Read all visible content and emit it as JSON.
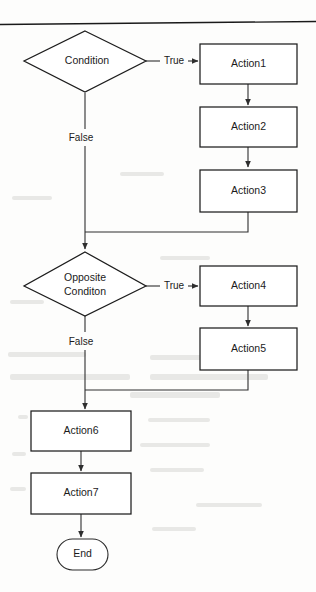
{
  "diagram": {
    "type": "flowchart",
    "colors": {
      "stroke": "#1d1d1d",
      "text": "#1b1b1b",
      "background": "#fdfdfc",
      "connector": "#2e2e2e"
    },
    "nodes": [
      {
        "id": "cond1",
        "shape": "diamond",
        "label": "Condition",
        "cx": 85,
        "cy": 61
      },
      {
        "id": "cond2a",
        "shape": "diamond",
        "label": "Opposite",
        "cx": 85,
        "cy": 277
      },
      {
        "id": "cond2b",
        "shape": "diamond",
        "label": "Conditon",
        "cx": 85,
        "cy": 290
      },
      {
        "id": "action1",
        "shape": "process",
        "label": "Action1",
        "cx": 248,
        "cy": 63
      },
      {
        "id": "action2",
        "shape": "process",
        "label": "Action2",
        "cx": 248,
        "cy": 127
      },
      {
        "id": "action3",
        "shape": "process",
        "label": "Action3",
        "cx": 248,
        "cy": 191
      },
      {
        "id": "action4",
        "shape": "process",
        "label": "Action4",
        "cx": 248,
        "cy": 286
      },
      {
        "id": "action5",
        "shape": "process",
        "label": "Action5",
        "cx": 248,
        "cy": 349
      },
      {
        "id": "action6",
        "shape": "process",
        "label": "Action6",
        "cx": 81,
        "cy": 431
      },
      {
        "id": "action7",
        "shape": "process",
        "label": "Action7",
        "cx": 81,
        "cy": 493
      },
      {
        "id": "end",
        "shape": "terminal",
        "label": "End",
        "cx": 82,
        "cy": 554
      }
    ],
    "edge_labels": {
      "true_1": "True",
      "false_1": "False",
      "true_2": "True",
      "false_2": "False"
    },
    "edges": [
      {
        "from": "cond1",
        "to": "action1",
        "label": "True"
      },
      {
        "from": "cond1",
        "to": "cond2a",
        "label": "False"
      },
      {
        "from": "action1",
        "to": "action2",
        "label": ""
      },
      {
        "from": "action2",
        "to": "action3",
        "label": ""
      },
      {
        "from": "action3",
        "to": "cond2a",
        "label": ""
      },
      {
        "from": "cond2a",
        "to": "action4",
        "label": "True"
      },
      {
        "from": "cond2a",
        "to": "action6",
        "label": "False"
      },
      {
        "from": "action4",
        "to": "action5",
        "label": ""
      },
      {
        "from": "action5",
        "to": "action6",
        "label": ""
      },
      {
        "from": "action6",
        "to": "action7",
        "label": ""
      },
      {
        "from": "action7",
        "to": "end",
        "label": ""
      }
    ]
  }
}
